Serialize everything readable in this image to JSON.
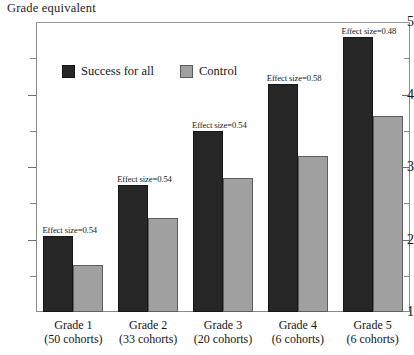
{
  "chart_data": {
    "type": "bar",
    "title": "",
    "ylabel": "Grade equivalent",
    "xlabel": "",
    "ylim": [
      1,
      5
    ],
    "yticks": [
      "1",
      "2",
      "3",
      "4",
      "5"
    ],
    "yminor_step": 0.5,
    "grid": false,
    "legend_position": "top-left-inside",
    "categories": [
      "Grade 1",
      "Grade 2",
      "Grade 3",
      "Grade 4",
      "Grade 5"
    ],
    "category_sublabels": [
      "(50 cohorts)",
      "(33 cohorts)",
      "(20 cohorts)",
      "(6 cohorts)",
      "(6 cohorts)"
    ],
    "series": [
      {
        "name": "Success for all",
        "color": "#262626",
        "values": [
          2.05,
          2.75,
          3.5,
          4.15,
          4.8
        ]
      },
      {
        "name": "Control",
        "color": "#a0a0a0",
        "values": [
          1.65,
          2.3,
          2.85,
          3.15,
          3.7
        ]
      }
    ],
    "annotations": [
      "Effect size=0.54",
      "Effect size=0.54",
      "Effect size=0.54",
      "Effect size=0.58",
      "Effect size=0.48"
    ]
  },
  "axis": {
    "y_title": "Grade equivalent",
    "tick_5": "5",
    "tick_4": "4",
    "tick_3": "3",
    "tick_2": "2",
    "tick_1": "1"
  },
  "legend": {
    "treatment_label": "Success for all",
    "control_label": "Control"
  },
  "colors": {
    "treatment": "#262626",
    "control": "#a0a0a0",
    "frame": "#8b8b8b",
    "background": "#ffffff"
  }
}
